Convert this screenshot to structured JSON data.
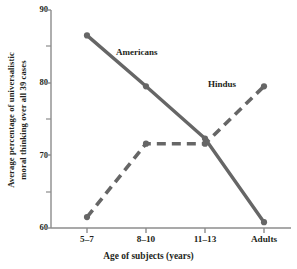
{
  "chart_data": {
    "type": "line",
    "title": "",
    "xlabel": "Age of subjects (years)",
    "ylabel": "Average percentage of universalistic moral thinking over all 39 cases",
    "ylabel_line1": "Average percentage of universalistic",
    "ylabel_line2": "moral thinking over all 39 cases",
    "categories": [
      "5–7",
      "8–10",
      "11–13",
      "Adults"
    ],
    "ylim": [
      60,
      90
    ],
    "yticks": [
      60,
      70,
      80,
      90
    ],
    "ytick_labels": [
      "60",
      "70",
      "80",
      "90"
    ],
    "yminor_ticks": [
      65,
      75,
      85
    ],
    "grid": false,
    "legend": "inline annotations",
    "series": [
      {
        "name": "Americans",
        "values": [
          86.5,
          79.5,
          72.3,
          60.8
        ],
        "style": "solid",
        "color": "#666666"
      },
      {
        "name": "Hindus",
        "values": [
          61.5,
          71.6,
          71.6,
          79.5
        ],
        "style": "dashed",
        "color": "#666666"
      }
    ],
    "annotations": [
      {
        "text": "Americans",
        "series": "Americans"
      },
      {
        "text": "Hindus",
        "series": "Hindus"
      }
    ],
    "colors": {
      "line": "#666666",
      "axis": "#888888",
      "text": "#231f20",
      "background": "#ffffff"
    }
  },
  "axes": {
    "y_title_line1": "Average percentage of universalistic",
    "y_title_line2": "moral thinking over all 39 cases",
    "x_title": "Age of subjects (years)",
    "y_tick_90": "90",
    "y_tick_80": "80",
    "y_tick_70": "70",
    "y_tick_60": "60",
    "x_tick_0": "5–7",
    "x_tick_1": "8–10",
    "x_tick_2": "11–13",
    "x_tick_3": "Adults"
  },
  "notes": {
    "americans": "Americans",
    "hindus": "Hindus"
  }
}
